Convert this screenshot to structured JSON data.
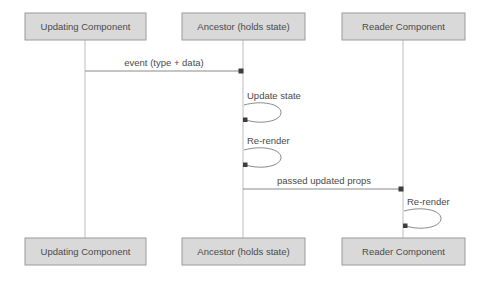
{
  "diagram": {
    "type": "sequence-diagram",
    "title": "",
    "background_color": "#ffffff",
    "box_fill_color": "#d9d9d9",
    "box_border_color": "#9a9a9a",
    "text_color": "#4a4a4a",
    "line_color": "#8a8a8a",
    "lifeline_color": "#bdbdbd",
    "participants": [
      {
        "id": "updating",
        "label": "Updating Component",
        "lifeline_x": 85,
        "box_x": 25,
        "box_width": 121
      },
      {
        "id": "ancestor",
        "label": "Ancestor (holds state)",
        "lifeline_x": 243,
        "box_x": 182,
        "box_width": 123
      },
      {
        "id": "reader",
        "label": "Reader Component",
        "lifeline_x": 403,
        "box_x": 342,
        "box_width": 123
      }
    ],
    "box_geometry": {
      "top_y": 13,
      "bottom_y": 238,
      "height": 27
    },
    "messages": [
      {
        "id": "msg-event",
        "label": "event (type + data)",
        "from": "updating",
        "to": "ancestor",
        "from_x": 85,
        "to_x": 243,
        "y": 71,
        "label_x": 164,
        "label_y": 66,
        "direction": "right"
      },
      {
        "id": "msg-passed-props",
        "label": "passed updated props",
        "from": "ancestor",
        "to": "reader",
        "from_x": 243,
        "to_x": 403,
        "y": 189,
        "label_x": 324,
        "label_y": 184,
        "direction": "right"
      }
    ],
    "self_messages": [
      {
        "id": "self-update-state",
        "label": "Update state",
        "participant": "ancestor",
        "lifeline_x": 243,
        "label_x": 247,
        "label_y": 99,
        "loop_top_y": 104,
        "loop_bottom_y": 121,
        "loop_width": 36
      },
      {
        "id": "self-rerender-ancestor",
        "label": "Re-render",
        "participant": "ancestor",
        "lifeline_x": 243,
        "label_x": 247,
        "label_y": 144,
        "loop_top_y": 149,
        "loop_bottom_y": 166,
        "loop_width": 36
      },
      {
        "id": "self-rerender-reader",
        "label": "Re-render",
        "participant": "reader",
        "lifeline_x": 403,
        "label_x": 407,
        "label_y": 205,
        "loop_top_y": 210,
        "loop_bottom_y": 227,
        "loop_width": 36
      }
    ]
  }
}
